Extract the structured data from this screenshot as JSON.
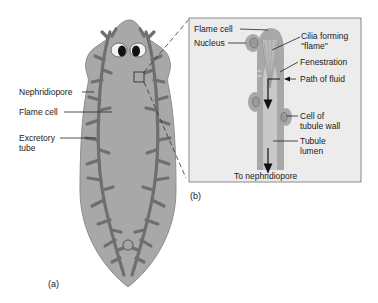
{
  "figure": {
    "panel_a": {
      "label": "(a)",
      "labels": {
        "nephridiopore": "Nephridiopore",
        "flame_cell": "Flame cell",
        "excretory_tube_line1": "Excretory",
        "excretory_tube_line2": "tube"
      }
    },
    "panel_b": {
      "label": "(b)",
      "labels": {
        "flame_cell": "Flame cell",
        "nucleus": "Nucleus",
        "cilia_line1": "Cilia forming",
        "cilia_line2": "\"flame\"",
        "fenestration": "Fenestration",
        "path_of_fluid": "Path of fluid",
        "cell_of_tubule_line1": "Cell of",
        "cell_of_tubule_line2": "tubule wall",
        "tubule_lumen_line1": "Tubule",
        "tubule_lumen_line2": "lumen",
        "to_nephridiopore": "To nephridiopore"
      }
    },
    "colors": {
      "body_fill": "#a8a8a8",
      "body_edge": "#8c8c8c",
      "tubule": "#6f6f6f",
      "inset_bg": "#ececec",
      "inset_border": "#8a8a8a",
      "tube_light": "#c8c8c8"
    }
  }
}
